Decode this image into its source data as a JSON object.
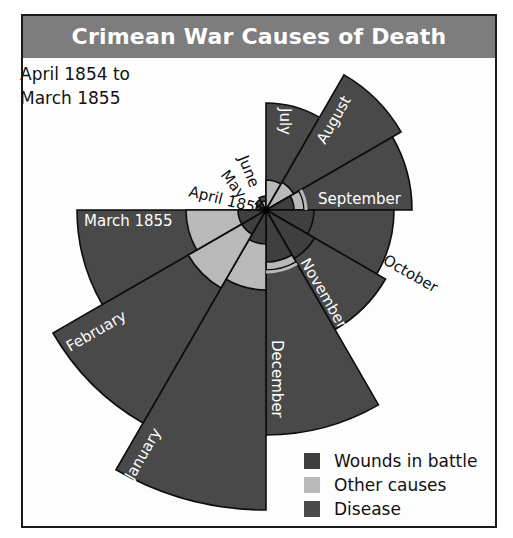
{
  "title": "Crimean War Causes of Death",
  "subtitle_line1": "April 1854 to",
  "subtitle_line2": "March 1855",
  "colors": {
    "title_bar": "#7d7d7d",
    "wounds": "#3f3f3f",
    "other": "#b9b9b9",
    "disease": "#494949",
    "outline": "#0d0d0d"
  },
  "legend": [
    {
      "label": "Wounds in battle",
      "color": "#3f3f3f"
    },
    {
      "label": "Other causes",
      "color": "#b9b9b9"
    },
    {
      "label": "Disease",
      "color": "#4a4a4a"
    }
  ],
  "chart_data": {
    "type": "polar-area",
    "title": "Crimean War Causes of Death",
    "subtitle": "April 1854 to March 1855",
    "unit": "relative radius (px, read from figure)",
    "categories": [
      "April 1854",
      "May",
      "June",
      "July",
      "August",
      "September",
      "October",
      "November",
      "December",
      "January",
      "February",
      "March 1855"
    ],
    "series": [
      {
        "name": "Disease",
        "values": [
          10,
          12,
          14,
          107,
          156,
          146,
          128,
          138,
          225,
          300,
          246,
          189
        ]
      },
      {
        "name": "Other causes",
        "values": [
          6,
          8,
          9,
          30,
          32,
          38,
          38,
          40,
          60,
          80,
          90,
          80
        ]
      },
      {
        "name": "Wounds in battle",
        "values": [
          0,
          0,
          0,
          0,
          0,
          28,
          48,
          56,
          52,
          34,
          28,
          28
        ]
      }
    ],
    "legend_position": "bottom-right",
    "grid": false
  }
}
